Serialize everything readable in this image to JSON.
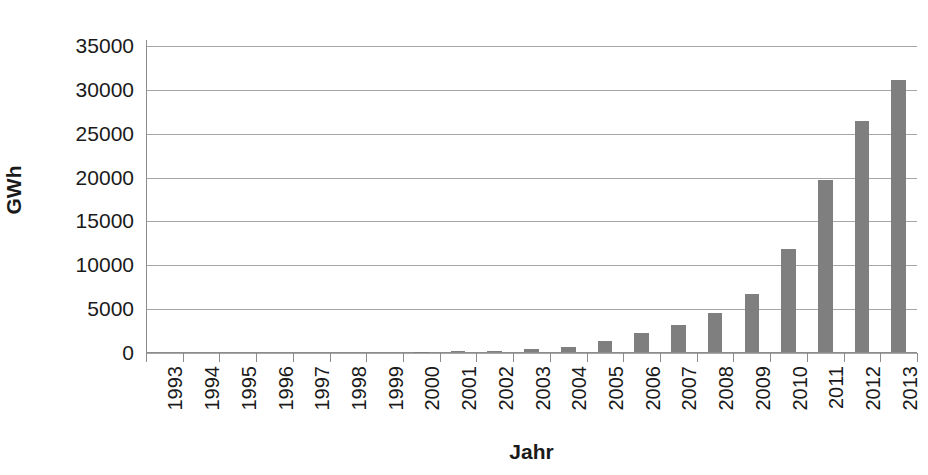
{
  "chart_data": {
    "type": "bar",
    "title": "",
    "xlabel": "Jahr",
    "ylabel": "GWh",
    "categories": [
      "1993",
      "1994",
      "1995",
      "1996",
      "1997",
      "1998",
      "1999",
      "2000",
      "2001",
      "2002",
      "2003",
      "2004",
      "2005",
      "2006",
      "2007",
      "2008",
      "2009",
      "2010",
      "2011",
      "2012",
      "2013"
    ],
    "values": [
      0,
      0,
      0,
      0,
      0,
      0,
      0,
      30,
      60,
      160,
      310,
      560,
      1280,
      2220,
      3080,
      4420,
      6580,
      11730,
      19600,
      26380,
      31010
    ],
    "series": [
      {
        "name": "GWh",
        "values": [
          0,
          0,
          0,
          0,
          0,
          0,
          0,
          30,
          60,
          160,
          310,
          560,
          1280,
          2220,
          3080,
          4420,
          6580,
          11730,
          19600,
          26380,
          31010
        ]
      }
    ],
    "ylim": [
      0,
      35000
    ],
    "yticks": [
      0,
      5000,
      10000,
      15000,
      20000,
      25000,
      30000,
      35000
    ],
    "ytick_labels": [
      "0",
      "5000",
      "10000",
      "15000",
      "20000",
      "25000",
      "30000",
      "35000"
    ],
    "grid": true,
    "grid_axis": "y",
    "legend": false,
    "legend_position": "none",
    "bar_color": "#7f7f7f",
    "grid_color": "#a6a6a6",
    "axis_color": "#8c8c8c",
    "text_color": "#1a1a1a",
    "background": "#ffffff",
    "xtick_label_rotation": -90
  }
}
